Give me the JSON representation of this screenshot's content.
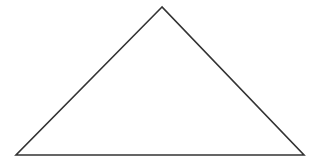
{
  "diagram": {
    "shape": "triangle",
    "type": "obtuse isosceles triangle",
    "vertices": {
      "apex": [
        162,
        7
      ],
      "bottom_left": [
        16,
        155
      ],
      "bottom_right": [
        304,
        155
      ]
    },
    "stroke_color": "#333333",
    "fill_color": "#ffffff",
    "stroke_width": 1.6
  }
}
